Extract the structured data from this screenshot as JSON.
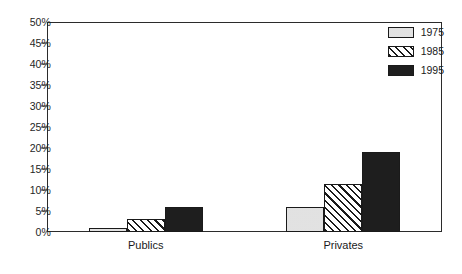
{
  "chart_data": {
    "type": "bar",
    "title": "",
    "xlabel": "",
    "ylabel": "",
    "categories": [
      "Publics",
      "Privates"
    ],
    "series": [
      {
        "name": "1975",
        "values": [
          1,
          6
        ],
        "color": "#d2d2d2",
        "pattern": "solid-light-gray"
      },
      {
        "name": "1985",
        "values": [
          3,
          11.5
        ],
        "color": "#ffffff",
        "pattern": "diagonal-hatch"
      },
      {
        "name": "1995",
        "values": [
          6,
          19
        ],
        "color": "#1e1e1e",
        "pattern": "solid-black"
      }
    ],
    "ylim": [
      0,
      50
    ],
    "ytick_step": 5,
    "ytick_labels": [
      "0%",
      "5%",
      "10%",
      "15%",
      "20%",
      "25%",
      "30%",
      "35%",
      "40%",
      "45%",
      "50%"
    ],
    "ytick_values": [
      0,
      5,
      10,
      15,
      20,
      25,
      30,
      35,
      40,
      45,
      50
    ],
    "grid": false,
    "legend_position": "top-right",
    "value_suffix": "%"
  },
  "axis": {
    "frame_color": "#2b2b2b"
  }
}
